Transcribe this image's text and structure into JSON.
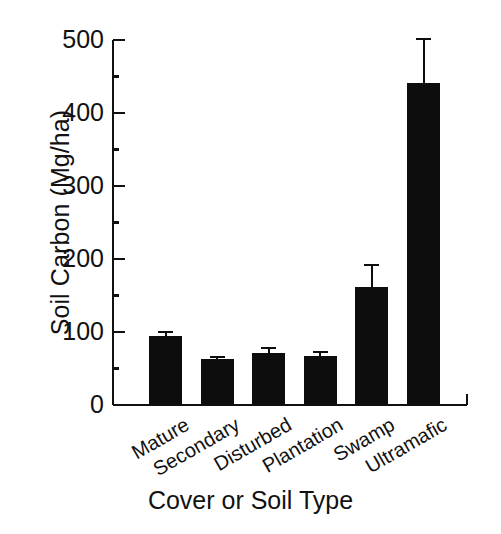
{
  "chart_data": {
    "type": "bar",
    "title": "",
    "xlabel": "Cover or Soil Type",
    "ylabel": "Soil Carbon (Mg/ha)",
    "categories": [
      "Mature",
      "Secondary",
      "Disturbed",
      "Plantation",
      "Swamp",
      "Ultramafic"
    ],
    "values": [
      94,
      63,
      71,
      67,
      162,
      441
    ],
    "errors": [
      7,
      4,
      8,
      7,
      31,
      62
    ],
    "error_type": "standard-error-upper",
    "ylim": [
      0,
      500
    ],
    "ytick_labels": [
      "0",
      "100",
      "200",
      "300",
      "400",
      "500"
    ],
    "ytick_values": [
      0,
      100,
      200,
      300,
      400,
      500
    ],
    "yminor_tick_values": [
      50,
      150,
      250,
      350,
      450
    ],
    "grid": false,
    "legend": null,
    "bar_color": "#0d0d0d",
    "axis_color": "#111111",
    "background_color": "#ffffff",
    "xtick_label_rotation_deg": -30,
    "series": [
      {
        "name": "Soil Carbon",
        "values": [
          94,
          63,
          71,
          67,
          162,
          441
        ],
        "errors": [
          7,
          4,
          8,
          7,
          31,
          62
        ]
      }
    ]
  },
  "figure": {
    "xlabel": "Cover or Soil Type",
    "ylabel": "Soil Carbon (Mg/ha)"
  }
}
